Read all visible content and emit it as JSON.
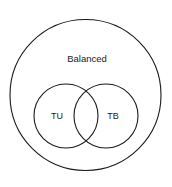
{
  "diagram": {
    "type": "venn-euler",
    "background_color": "#ffffff",
    "stroke_color": "#1a1a1a",
    "sets": [
      {
        "id": "balanced",
        "label": "Balanced",
        "role": "universe",
        "shape": "circle",
        "cx": 85.5,
        "cy": 95,
        "r": 75.5,
        "stroke_width": 1.1,
        "label_x": 87,
        "label_y": 59
      },
      {
        "id": "tu",
        "label": "TU",
        "role": "subset",
        "shape": "circle",
        "cx": 66,
        "cy": 116,
        "r": 32,
        "stroke_width": 1.1,
        "label_x": 57,
        "label_y": 117
      },
      {
        "id": "tb",
        "label": "TB",
        "role": "subset",
        "shape": "circle",
        "cx": 106,
        "cy": 116,
        "r": 32,
        "stroke_width": 1.1,
        "label_x": 113,
        "label_y": 117
      }
    ],
    "intersection": {
      "between": "TU and TB",
      "shape": "lens",
      "center_x": 86,
      "center_y": 116,
      "labeled": false
    }
  }
}
